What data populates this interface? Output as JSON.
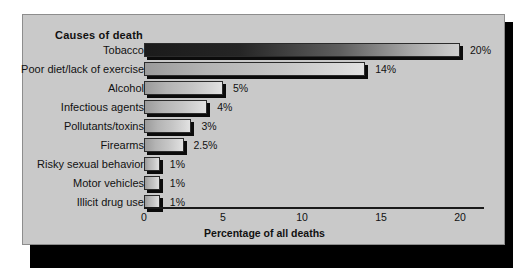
{
  "figure": {
    "title": "Causes of death",
    "axis_title": "Percentage of all deaths",
    "background_color": "#c9c9c9",
    "frame_border_color": "#8d8d8d",
    "shadow_color": "#000000"
  },
  "chart_data": {
    "type": "bar",
    "orientation": "horizontal",
    "title": "Causes of death",
    "xlabel": "Percentage of all deaths",
    "ylabel": "",
    "xlim": [
      0,
      21.5
    ],
    "grid": false,
    "legend": null,
    "xticks": [
      "0",
      "5",
      "10",
      "15",
      "20"
    ],
    "xtick_values": [
      0,
      5,
      10,
      15,
      20
    ],
    "categories": [
      "Tobacco",
      "Poor diet/lack of exercise",
      "Alcohol",
      "Infectious agents",
      "Pollutants/toxins",
      "Firearms",
      "Risky sexual behavior",
      "Motor vehicles",
      "Illicit drug use"
    ],
    "values": [
      20,
      14,
      5,
      4,
      3,
      2.5,
      1,
      1,
      1
    ],
    "data_labels": [
      "20%",
      "14%",
      "5%",
      "4%",
      "3%",
      "2.5%",
      "1%",
      "1%",
      "1%"
    ],
    "bar_styles": [
      "dark",
      "light",
      "light",
      "light",
      "light",
      "light",
      "light",
      "light",
      "light"
    ]
  }
}
